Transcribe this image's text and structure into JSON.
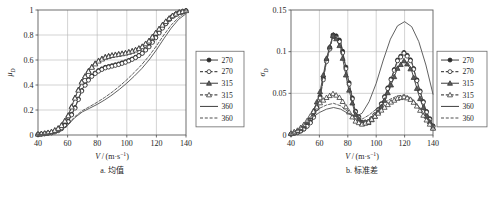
{
  "figure": {
    "panels": [
      {
        "id": "a",
        "caption": "a. 均值",
        "xlabel": "V/(m·s⁻¹)",
        "ylabel_base": "μ",
        "ylabel_sub": "D"
      },
      {
        "id": "b",
        "caption": "b. 标准差",
        "xlabel": "V/(m·s⁻¹)",
        "ylabel_base": "σ",
        "ylabel_sub": "D"
      }
    ]
  },
  "legend": {
    "entries": [
      {
        "label": "270",
        "style": "solid",
        "marker": "circle"
      },
      {
        "label": "270",
        "style": "dashed",
        "marker": "circle"
      },
      {
        "label": "315",
        "style": "solid",
        "marker": "triangle"
      },
      {
        "label": "315",
        "style": "dashed",
        "marker": "triangle"
      },
      {
        "label": "360",
        "style": "solid",
        "marker": "none"
      },
      {
        "label": "360",
        "style": "dashed",
        "marker": "none"
      }
    ]
  },
  "chart_data": [
    {
      "type": "line",
      "title": "a. 均值",
      "xlabel": "V/(m·s⁻¹)",
      "ylabel": "μ_D",
      "xlim": [
        40,
        140
      ],
      "ylim": [
        0,
        1
      ],
      "xticks": [
        40,
        60,
        80,
        100,
        120,
        140
      ],
      "yticks": [
        0,
        0.2,
        0.4,
        0.6,
        0.8,
        1
      ],
      "grid": true,
      "legend_position": "right-outside",
      "x": [
        40,
        45,
        50,
        55,
        60,
        65,
        70,
        75,
        80,
        85,
        90,
        95,
        100,
        105,
        110,
        115,
        120,
        125,
        130,
        135,
        140
      ],
      "series": [
        {
          "name": "270",
          "style": "solid",
          "marker": "circle",
          "values": [
            0.005,
            0.01,
            0.02,
            0.045,
            0.1,
            0.22,
            0.37,
            0.46,
            0.51,
            0.54,
            0.555,
            0.57,
            0.59,
            0.615,
            0.65,
            0.71,
            0.79,
            0.875,
            0.945,
            0.98,
            0.995
          ]
        },
        {
          "name": "270",
          "style": "dashed",
          "marker": "circle",
          "values": [
            0.005,
            0.01,
            0.018,
            0.04,
            0.095,
            0.215,
            0.365,
            0.455,
            0.505,
            0.535,
            0.55,
            0.565,
            0.585,
            0.612,
            0.648,
            0.705,
            0.785,
            0.87,
            0.942,
            0.978,
            0.993
          ]
        },
        {
          "name": "315",
          "style": "solid",
          "marker": "triangle",
          "values": [
            0.008,
            0.015,
            0.03,
            0.065,
            0.145,
            0.3,
            0.44,
            0.53,
            0.59,
            0.625,
            0.64,
            0.65,
            0.66,
            0.678,
            0.705,
            0.755,
            0.825,
            0.895,
            0.95,
            0.982,
            0.996
          ]
        },
        {
          "name": "315",
          "style": "dashed",
          "marker": "triangle",
          "values": [
            0.008,
            0.014,
            0.028,
            0.062,
            0.14,
            0.295,
            0.435,
            0.525,
            0.585,
            0.62,
            0.636,
            0.646,
            0.657,
            0.675,
            0.702,
            0.752,
            0.822,
            0.892,
            0.948,
            0.98,
            0.995
          ]
        },
        {
          "name": "360",
          "style": "solid",
          "marker": "none",
          "values": [
            0.003,
            0.006,
            0.012,
            0.03,
            0.078,
            0.14,
            0.185,
            0.215,
            0.245,
            0.28,
            0.32,
            0.365,
            0.415,
            0.47,
            0.53,
            0.6,
            0.68,
            0.77,
            0.855,
            0.925,
            0.97
          ]
        },
        {
          "name": "360",
          "style": "dashed",
          "marker": "none",
          "values": [
            0.003,
            0.006,
            0.013,
            0.032,
            0.082,
            0.148,
            0.195,
            0.228,
            0.262,
            0.3,
            0.342,
            0.39,
            0.442,
            0.5,
            0.562,
            0.632,
            0.712,
            0.8,
            0.88,
            0.94,
            0.982
          ]
        }
      ]
    },
    {
      "type": "line",
      "title": "b. 标准差",
      "xlabel": "V/(m·s⁻¹)",
      "ylabel": "σ_D",
      "xlim": [
        40,
        140
      ],
      "ylim": [
        0,
        0.15
      ],
      "xticks": [
        40,
        60,
        80,
        100,
        120,
        140
      ],
      "yticks": [
        0,
        0.05,
        0.1,
        0.15
      ],
      "grid": true,
      "legend_position": "right-outside",
      "x": [
        40,
        45,
        50,
        55,
        60,
        65,
        70,
        75,
        80,
        85,
        90,
        95,
        100,
        105,
        110,
        115,
        120,
        125,
        130,
        135,
        140
      ],
      "series": [
        {
          "name": "270",
          "style": "solid",
          "marker": "circle",
          "values": [
            0.001,
            0.003,
            0.008,
            0.018,
            0.042,
            0.09,
            0.123,
            0.112,
            0.07,
            0.03,
            0.015,
            0.016,
            0.026,
            0.042,
            0.065,
            0.09,
            0.1,
            0.088,
            0.058,
            0.03,
            0.011
          ]
        },
        {
          "name": "270",
          "style": "dashed",
          "marker": "circle",
          "values": [
            0.001,
            0.003,
            0.008,
            0.017,
            0.04,
            0.088,
            0.121,
            0.11,
            0.068,
            0.029,
            0.015,
            0.016,
            0.026,
            0.041,
            0.064,
            0.089,
            0.099,
            0.087,
            0.057,
            0.029,
            0.01
          ]
        },
        {
          "name": "315",
          "style": "solid",
          "marker": "triangle",
          "values": [
            0.002,
            0.005,
            0.012,
            0.025,
            0.048,
            0.092,
            0.122,
            0.104,
            0.06,
            0.026,
            0.014,
            0.015,
            0.024,
            0.038,
            0.058,
            0.08,
            0.09,
            0.077,
            0.048,
            0.024,
            0.009
          ]
        },
        {
          "name": "315",
          "style": "dashed",
          "marker": "triangle",
          "values": [
            0.002,
            0.006,
            0.014,
            0.026,
            0.038,
            0.045,
            0.05,
            0.044,
            0.03,
            0.017,
            0.013,
            0.016,
            0.024,
            0.032,
            0.039,
            0.044,
            0.046,
            0.042,
            0.032,
            0.019,
            0.008
          ]
        },
        {
          "name": "360",
          "style": "solid",
          "marker": "none",
          "values": [
            0.002,
            0.006,
            0.013,
            0.021,
            0.027,
            0.031,
            0.033,
            0.031,
            0.026,
            0.022,
            0.026,
            0.04,
            0.062,
            0.09,
            0.115,
            0.131,
            0.136,
            0.13,
            0.112,
            0.084,
            0.049
          ]
        },
        {
          "name": "360",
          "style": "dashed",
          "marker": "none",
          "values": [
            0.002,
            0.007,
            0.015,
            0.024,
            0.032,
            0.036,
            0.038,
            0.035,
            0.028,
            0.02,
            0.019,
            0.024,
            0.031,
            0.038,
            0.043,
            0.047,
            0.048,
            0.044,
            0.034,
            0.021,
            0.009
          ]
        }
      ]
    }
  ]
}
